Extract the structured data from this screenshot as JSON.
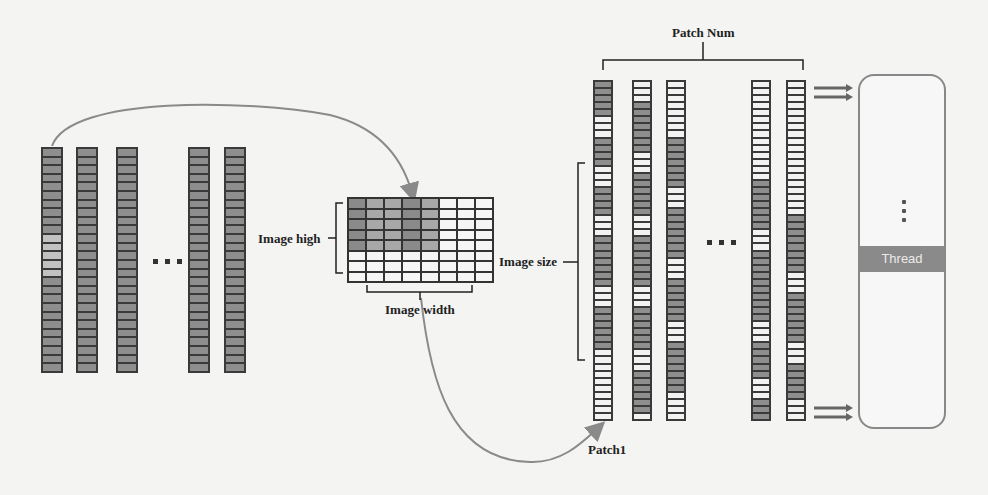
{
  "labels": {
    "image_high": "Image high",
    "image_width": "Image width",
    "image_size": "Image size",
    "patch_num": "Patch Num",
    "patch1": "Patch1",
    "thread": "Thread"
  },
  "icons": {
    "ellipsis": "three-dots",
    "vertical_ellipsis": "vertical-three-dots",
    "wave": "wavy-lines",
    "arrow": "double-arrow"
  },
  "colors": {
    "dark_cell": "#8e8e8e",
    "light_cell": "#f2f2f2",
    "border": "#3a3a3a",
    "arrow": "#8a8a8a",
    "thread_bar": "#8a8a8a"
  },
  "input_columns": {
    "count_visible": 5,
    "cells_per_column": 26,
    "patterns": [
      "DDDDDDDDDDPPPPPDDDDDDDDDDD",
      "DDDDDDDDDDDDDDDDDDDDDDDDDD",
      "DDDDDDDDDDDDDDDDDDDDDDDDDD",
      "DDDDDDDDDDDDDDDDDDDDDDDDDD",
      "DDDDDDDDDDDDDDDDDDDDDDDDDD"
    ]
  },
  "image_grid": {
    "rows": 8,
    "cols": 8,
    "shaded_rows": 5,
    "shaded_cols": 5
  },
  "patch_columns": {
    "count_visible": 5,
    "cells_per_column": 48,
    "patterns": [
      "DDDDDLLLDDDDLLLDDDDLLLDDDDDDDLLLDDDDDDLLLLLLLLLL",
      "LLLDDDDDDDLLLDDDDDDLLLDDDDDDDLLLDDDDDDLLLDDDDDDL",
      "LLLLLLLLDDDDDDDLLLDDDDDDDLLLDDDDDDLLLDDDDDDDLLLL",
      "LLLLLLLLLLLLLLDDDDDDDLLLDDDDDDDDDDLLLDDDDDLLLDDD",
      "LLLLLLLLLLLLLLLLLLLDDDDDDDDLLLDDDDDDDLLLDDDDDLLL"
    ]
  }
}
